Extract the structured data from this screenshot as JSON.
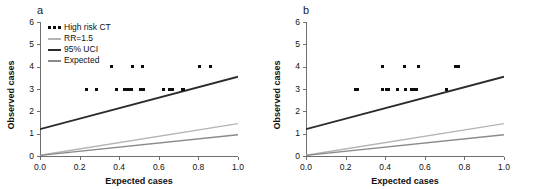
{
  "figure": {
    "panels": [
      {
        "letter": "a",
        "has_legend": true,
        "xlabel": "Expected cases",
        "ylabel": "Observed cases"
      },
      {
        "letter": "b",
        "has_legend": false,
        "xlabel": "Expected cases",
        "ylabel": "Observed cases"
      }
    ],
    "legend": {
      "items": [
        {
          "label": "High risk CT",
          "marker": "dots",
          "color": "#0d0d0d"
        },
        {
          "label": "RR=1.5",
          "marker": "line",
          "color": "#b4b4b4"
        },
        {
          "label": "95% UCI",
          "marker": "line",
          "color": "#2b2b2b"
        },
        {
          "label": "Expected",
          "marker": "line",
          "color": "#8a8a8a"
        }
      ]
    }
  },
  "chart_data": [
    {
      "type": "scatter",
      "panel": "a",
      "title": "",
      "xlabel": "Expected cases",
      "ylabel": "Observed cases",
      "xlim": [
        0.0,
        1.0
      ],
      "ylim": [
        0,
        6
      ],
      "xticks": [
        0.0,
        0.2,
        0.4,
        0.6,
        0.8,
        1.0
      ],
      "xtick_labels": [
        "0.0",
        "0.2",
        "0.4",
        "0.6",
        "0.8",
        "1.0"
      ],
      "yticks": [
        0,
        1,
        2,
        3,
        4,
        5,
        6
      ],
      "ytick_labels": [
        "0",
        "1",
        "2",
        "3",
        "4",
        "5",
        "6"
      ],
      "grid": false,
      "legend_position": "top-left",
      "series": [
        {
          "name": "High risk CT",
          "type": "scatter",
          "color": "#0d0d0d",
          "points": [
            [
              0.235,
              3
            ],
            [
              0.285,
              3
            ],
            [
              0.36,
              4
            ],
            [
              0.385,
              3
            ],
            [
              0.425,
              3
            ],
            [
              0.438,
              3
            ],
            [
              0.447,
              3
            ],
            [
              0.456,
              3
            ],
            [
              0.464,
              3
            ],
            [
              0.466,
              4
            ],
            [
              0.508,
              3
            ],
            [
              0.525,
              3
            ],
            [
              0.52,
              4
            ],
            [
              0.625,
              3
            ],
            [
              0.655,
              3
            ],
            [
              0.668,
              3
            ],
            [
              0.718,
              3
            ],
            [
              0.726,
              3
            ],
            [
              0.808,
              4
            ],
            [
              0.862,
              4
            ]
          ]
        },
        {
          "name": "95% UCI",
          "type": "line",
          "color": "#2b2b2b",
          "x": [
            0.0,
            1.0
          ],
          "values": [
            1.2,
            3.55
          ]
        },
        {
          "name": "RR=1.5",
          "type": "line",
          "color": "#b4b4b4",
          "x": [
            0.0,
            1.0
          ],
          "values": [
            0.03,
            1.45
          ]
        },
        {
          "name": "Expected",
          "type": "line",
          "color": "#8a8a8a",
          "x": [
            0.0,
            1.0
          ],
          "values": [
            0.03,
            0.95
          ]
        }
      ]
    },
    {
      "type": "scatter",
      "panel": "b",
      "title": "",
      "xlabel": "Expected cases",
      "ylabel": "Observed cases",
      "xlim": [
        0.0,
        1.0
      ],
      "ylim": [
        0,
        6
      ],
      "xticks": [
        0.0,
        0.2,
        0.4,
        0.6,
        0.8,
        1.0
      ],
      "xtick_labels": [
        "0.0",
        "0.2",
        "0.4",
        "0.6",
        "0.8",
        "1.0"
      ],
      "yticks": [
        0,
        1,
        2,
        3,
        4,
        5,
        6
      ],
      "ytick_labels": [
        "0",
        "1",
        "2",
        "3",
        "4",
        "5",
        "6"
      ],
      "grid": false,
      "legend_position": "none",
      "series": [
        {
          "name": "High risk CT",
          "type": "scatter",
          "color": "#0d0d0d",
          "points": [
            [
              0.248,
              3
            ],
            [
              0.258,
              3
            ],
            [
              0.388,
              4
            ],
            [
              0.385,
              3
            ],
            [
              0.405,
              3
            ],
            [
              0.418,
              3
            ],
            [
              0.462,
              3
            ],
            [
              0.497,
              4
            ],
            [
              0.505,
              3
            ],
            [
              0.532,
              3
            ],
            [
              0.545,
              3
            ],
            [
              0.556,
              3
            ],
            [
              0.57,
              4
            ],
            [
              0.71,
              3
            ],
            [
              0.755,
              4
            ],
            [
              0.772,
              4
            ]
          ]
        },
        {
          "name": "95% UCI",
          "type": "line",
          "color": "#2b2b2b",
          "x": [
            0.0,
            1.0
          ],
          "values": [
            1.2,
            3.55
          ]
        },
        {
          "name": "RR=1.5",
          "type": "line",
          "color": "#b4b4b4",
          "x": [
            0.0,
            1.0
          ],
          "values": [
            0.03,
            1.45
          ]
        },
        {
          "name": "Expected",
          "type": "line",
          "color": "#8a8a8a",
          "x": [
            0.0,
            1.0
          ],
          "values": [
            0.03,
            0.95
          ]
        }
      ]
    }
  ]
}
